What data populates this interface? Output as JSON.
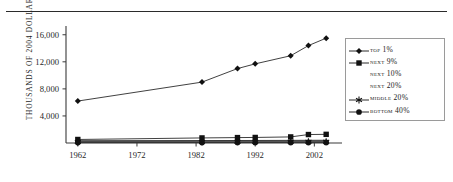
{
  "chart_data": {
    "type": "line",
    "title": "",
    "xlabel": "",
    "ylabel": "THOUSANDS OF 2004 DOLLARS",
    "xlim": [
      1960,
      2006
    ],
    "ylim": [
      0,
      17000
    ],
    "grid": false,
    "legend_position": "right",
    "x": [
      1962,
      1983,
      1989,
      1992,
      1998,
      2001,
      2004
    ],
    "xticks": [
      "1962",
      "1972",
      "1982",
      "1992",
      "2002"
    ],
    "xtick_values": [
      1962,
      1972,
      1982,
      1992,
      2002
    ],
    "yticks": [
      "4,000",
      "8,000",
      "12,000",
      "16,000"
    ],
    "ytick_values": [
      4000,
      8000,
      12000,
      16000
    ],
    "series": [
      {
        "name": "TOP 1%",
        "marker": "diamond",
        "values": [
          6200,
          9000,
          11000,
          11700,
          12900,
          14400,
          15500
        ]
      },
      {
        "name": "NEXT 9%",
        "marker": "square",
        "values": [
          520,
          750,
          800,
          820,
          900,
          1250,
          1280
        ]
      },
      {
        "name": "NEXT 10%",
        "marker": "none",
        "values": [
          330,
          360,
          370,
          375,
          390,
          400,
          405
        ]
      },
      {
        "name": "NEXT 20%",
        "marker": "none",
        "values": [
          260,
          280,
          285,
          288,
          295,
          300,
          305
        ]
      },
      {
        "name": "MIDDLE 20%",
        "marker": "asterisk",
        "values": [
          150,
          165,
          170,
          172,
          178,
          182,
          185
        ]
      },
      {
        "name": "BOTTOM 40%",
        "marker": "circle",
        "values": [
          60,
          70,
          72,
          74,
          78,
          80,
          82
        ]
      }
    ]
  },
  "legend": {
    "items": [
      {
        "label": "TOP 1%",
        "marker": "diamond"
      },
      {
        "label": "NEXT 9%",
        "marker": "square"
      },
      {
        "label": "NEXT 10%",
        "marker": "none"
      },
      {
        "label": "NEXT 20%",
        "marker": "none"
      },
      {
        "label": "MIDDLE 20%",
        "marker": "asterisk"
      },
      {
        "label": "BOTTOM 40%",
        "marker": "circle"
      }
    ]
  },
  "colors": {
    "line": "#2b2b2b",
    "marker": "#111111",
    "axis": "#3a3a3a",
    "legend_border": "#9a9a9a",
    "text": "#1f1f1f",
    "background": "#ffffff"
  }
}
